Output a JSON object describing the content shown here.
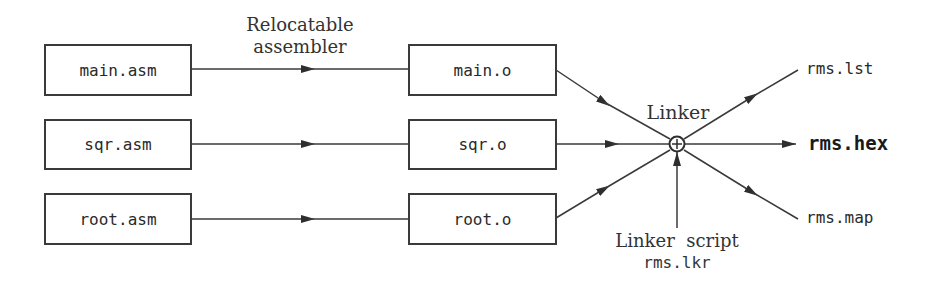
{
  "diagram": {
    "stage_label_line1": "Relocatable",
    "stage_label_line2": "assembler",
    "sources": [
      "main.asm",
      "sqr.asm",
      "root.asm"
    ],
    "objects": [
      "main.o",
      "sqr.o",
      "root.o"
    ],
    "linker_label": "Linker",
    "linker_script_label": "Linker  script",
    "linker_script_file": "rms.lkr",
    "outputs": {
      "listing": "rms.lst",
      "hex": "rms.hex",
      "map": "rms.map"
    },
    "colors": {
      "line": "#3a3a3a",
      "text": "#2a2a2a",
      "background": "#ffffff"
    }
  }
}
